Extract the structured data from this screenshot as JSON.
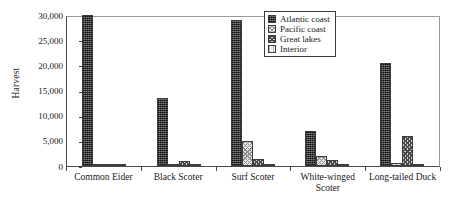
{
  "chart_data": {
    "type": "bar",
    "title": "",
    "xlabel": "",
    "ylabel": "Harvest",
    "ylim": [
      0,
      30000
    ],
    "yticks": [
      0,
      5000,
      10000,
      15000,
      20000,
      25000,
      30000
    ],
    "ytick_labels": [
      "0",
      "5,000",
      "10,000",
      "15,000",
      "20,000",
      "25,000",
      "30,000"
    ],
    "grid": false,
    "legend_position": "top-right",
    "categories": [
      "Common Eider",
      "Black Scoter",
      "Surf Scoter",
      "White-winged Scoter",
      "Long-tailed Duck"
    ],
    "series": [
      {
        "name": "Atlantic coast",
        "pattern": "dark-dotted",
        "values": [
          30000,
          13500,
          29000,
          7000,
          20500
        ]
      },
      {
        "name": "Pacific coast",
        "pattern": "light-checker",
        "values": [
          300,
          200,
          5000,
          2000,
          500
        ]
      },
      {
        "name": "Great lakes",
        "pattern": "medium-checker",
        "values": [
          0,
          1000,
          1300,
          1200,
          6000
        ]
      },
      {
        "name": "Interior",
        "pattern": "light-hatch",
        "values": [
          150,
          150,
          300,
          250,
          200
        ]
      }
    ]
  },
  "legend": {
    "items": [
      {
        "label": "Atlantic coast"
      },
      {
        "label": "Pacific coast"
      },
      {
        "label": "Great lakes"
      },
      {
        "label": "Interior"
      }
    ]
  }
}
